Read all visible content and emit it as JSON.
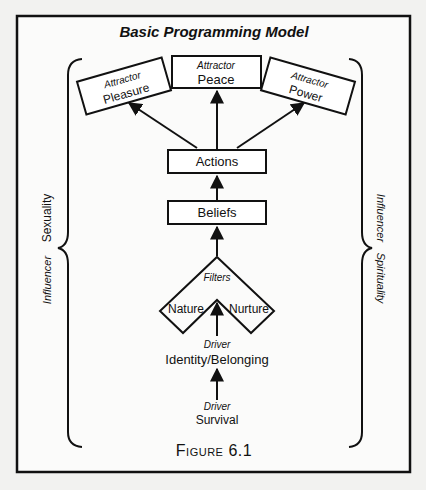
{
  "title": "Basic Programming Model",
  "caption": "Figure 6.1",
  "attractors": [
    {
      "label": "Attractor",
      "name": "Pleasure"
    },
    {
      "label": "Attractor",
      "name": "Peace"
    },
    {
      "label": "Attractor",
      "name": "Power"
    }
  ],
  "actions": "Actions",
  "beliefs": "Beliefs",
  "filters": {
    "label": "Filters",
    "left": "Nature",
    "right": "Nurture"
  },
  "drivers": [
    {
      "label": "Driver",
      "name": "Identity/Belonging"
    },
    {
      "label": "Driver",
      "name": "Survival"
    }
  ],
  "influencers": {
    "left": {
      "label": "Influencer",
      "name": "Sexuality"
    },
    "right": {
      "label": "Influencer",
      "name": "Spirituality"
    }
  },
  "colors": {
    "ink": "#111111",
    "paper": "#f2f2f0",
    "box": "#ffffff"
  }
}
